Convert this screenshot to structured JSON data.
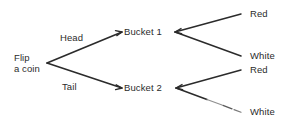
{
  "diagram": {
    "type": "probability-tree",
    "background_color": "#ffffff",
    "line_color": "#2b2b2b",
    "text_color": "#2b2b2b",
    "root": {
      "label_line1": "Flip",
      "label_line2": "a coin"
    },
    "edge_labels": {
      "head": "Head",
      "tail": "Tail"
    },
    "nodes": {
      "bucket1": "Bucket 1",
      "bucket2": "Bucket 2"
    },
    "leaves": {
      "bucket1_red": "Red",
      "bucket1_white": "White",
      "bucket2_red": "Red",
      "bucket2_white": "White"
    }
  }
}
